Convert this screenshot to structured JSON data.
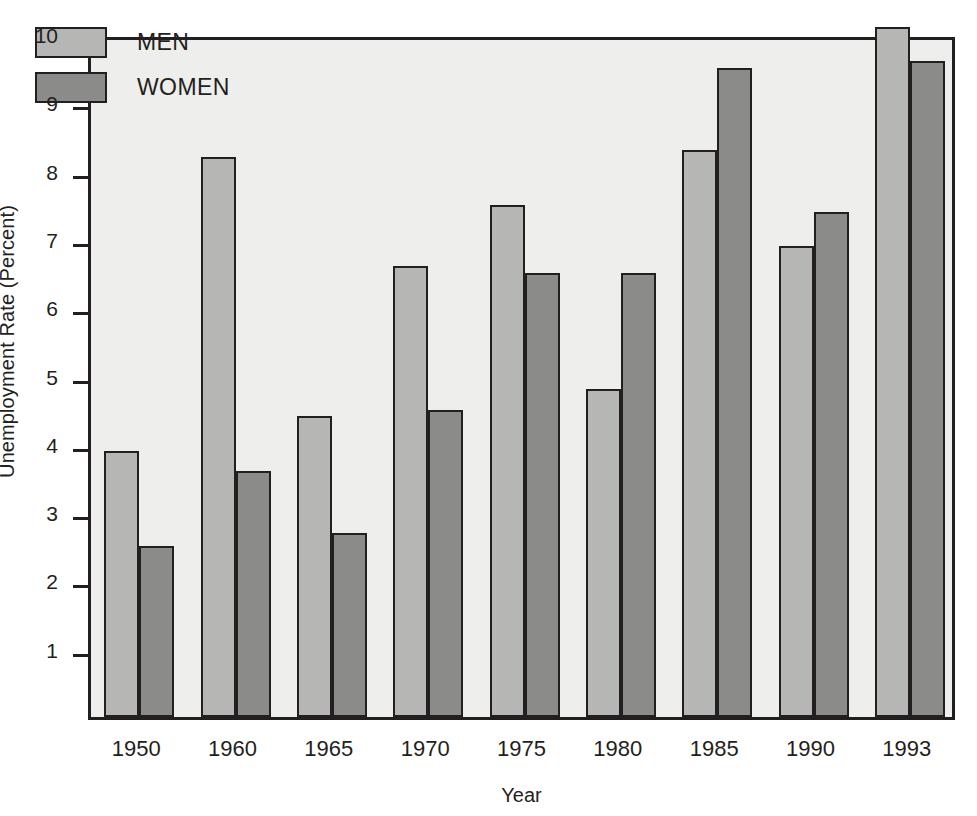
{
  "chart_data": {
    "type": "bar",
    "title": "",
    "subtitle": "",
    "xlabel": "Year",
    "ylabel": "Unemployment Rate (Percent)",
    "categories": [
      "1950",
      "1960",
      "1965",
      "1970",
      "1975",
      "1980",
      "1985",
      "1990",
      "1993"
    ],
    "series": [
      {
        "name": "MEN",
        "color": "#b6b6b4",
        "values": [
          3.9,
          8.2,
          4.4,
          6.6,
          7.5,
          4.8,
          8.3,
          6.9,
          10.1
        ]
      },
      {
        "name": "WOMEN",
        "color": "#8b8b89",
        "values": [
          2.5,
          3.6,
          2.7,
          4.5,
          6.5,
          6.5,
          9.5,
          7.4,
          9.6
        ]
      }
    ],
    "ylim": [
      0,
      10
    ],
    "yticks": [
      1,
      2,
      3,
      4,
      5,
      6,
      7,
      8,
      9,
      10
    ],
    "ytick_labels": [
      "1",
      "2",
      "3",
      "4",
      "5",
      "6",
      "7",
      "8",
      "9",
      "10"
    ],
    "grid": false,
    "legend_position": "top-left"
  },
  "legend": {
    "entries": [
      {
        "label": "MEN"
      },
      {
        "label": "WOMEN"
      }
    ]
  },
  "axes": {
    "y_title": "Unemployment Rate (Percent)",
    "x_title": "Year"
  }
}
